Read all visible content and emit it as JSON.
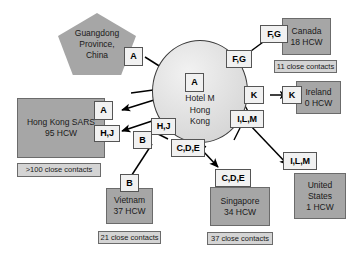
{
  "diagram": {
    "colors": {
      "node_fill": "#a6a6a6",
      "node_border": "#6b6b6b",
      "hub_fill": "#e2e2e2",
      "tag_fill": "#f1f1f1",
      "contacts_fill": "#d4d4d4",
      "arrow": "#000000"
    }
  },
  "hub": {
    "name": "hotel-m-hub",
    "lines": [
      "Hotel M",
      "Hong",
      "Kong"
    ]
  },
  "source": {
    "name": "guangdong-province",
    "lines": [
      "Guangdong",
      "Province,",
      "China"
    ]
  },
  "nodes": [
    {
      "id": "hong-kong-sars",
      "lines": [
        "Hong Kong SARS",
        "95 HCW"
      ],
      "contacts": ">100 close contacts"
    },
    {
      "id": "vietnam",
      "lines": [
        "Vietnam",
        "37 HCW"
      ],
      "contacts": "21 close contacts"
    },
    {
      "id": "canada",
      "lines": [
        "Canada",
        "18 HCW"
      ],
      "contacts": "11 close contacts"
    },
    {
      "id": "ireland",
      "lines": [
        "Ireland",
        "0 HCW"
      ],
      "contacts": null
    },
    {
      "id": "singapore",
      "lines": [
        "Singapore",
        "34 HCW"
      ],
      "contacts": "37 close contacts"
    },
    {
      "id": "united-states",
      "lines": [
        "United",
        "States",
        "1 HCW"
      ],
      "contacts": null
    }
  ],
  "tags": {
    "source_a": "A",
    "hub_a": "A",
    "hk_a": "A",
    "hub_hj": "H,J",
    "hk_hj": "H,J",
    "hub_b": "B",
    "vietnam_b": "B",
    "hub_fg": "F,G",
    "canada_fg": "F,G",
    "hub_k": "K",
    "ireland_k": "K",
    "hub_ilm": "I,L,M",
    "us_ilm": "I,L,M",
    "hub_cde": "C,D,E",
    "singapore_cde": "C,D,E"
  }
}
